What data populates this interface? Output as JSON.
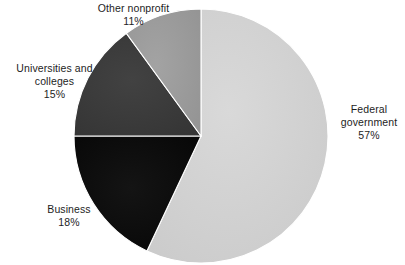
{
  "chart_data": {
    "type": "pie",
    "title": "",
    "subtitle": "",
    "xlabel": "",
    "ylabel": "",
    "legend_position": "none",
    "grid": false,
    "units": "percent",
    "start_angle_deg": 0,
    "direction": "clockwise",
    "categories": [
      "Federal government",
      "Business",
      "Universities and colleges",
      "Other nonprofit"
    ],
    "values": [
      57,
      18,
      15,
      11
    ],
    "labels": [
      "57%",
      "18%",
      "15%",
      "11%"
    ],
    "colors": [
      "#d2d2d2",
      "#0d0d0d",
      "#3c3c3c",
      "#9b9b9b"
    ],
    "slices": [
      {
        "name": "federal-government",
        "label_lines": [
          "Federal",
          "government"
        ],
        "value": 57,
        "value_label": "57%",
        "color": "#d2d2d2",
        "start_deg": 0,
        "end_deg": 205.2
      },
      {
        "name": "business",
        "label_lines": [
          "Business"
        ],
        "value": 18,
        "value_label": "18%",
        "color": "#0d0d0d",
        "start_deg": 205.2,
        "end_deg": 270.0
      },
      {
        "name": "universities-and-colleges",
        "label_lines": [
          "Universities and",
          "colleges"
        ],
        "value": 15,
        "value_label": "15%",
        "color": "#3c3c3c",
        "start_deg": 270.0,
        "end_deg": 324.0
      },
      {
        "name": "other-nonprofit",
        "label_lines": [
          "Other nonprofit"
        ],
        "value": 11,
        "value_label": "11%",
        "color": "#9b9b9b",
        "start_deg": 324.0,
        "end_deg": 360.0
      }
    ]
  },
  "labels": {
    "federal": {
      "line1": "Federal",
      "line2": "government",
      "percent": "57%"
    },
    "business": {
      "line1": "Business",
      "percent": "18%"
    },
    "universities": {
      "line1": "Universities and",
      "line2": "colleges",
      "percent": "15%"
    },
    "other_nonprofit": {
      "line1": "Other nonprofit",
      "percent": "11%"
    }
  },
  "geometry": {
    "center_x": 201,
    "center_y": 136,
    "radius": 127,
    "background": "#ffffff",
    "separator_color": "#ffffff"
  }
}
